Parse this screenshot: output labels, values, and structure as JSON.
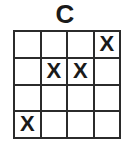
{
  "figure": {
    "title": "C",
    "mark_symbol": "X",
    "colors": {
      "background": "#ffffff",
      "grid_line": "#2b2b2b",
      "text": "#1a1a1a"
    }
  },
  "chart_data": {
    "type": "table",
    "title": "C",
    "xlabel": "",
    "ylabel": "",
    "rows": 4,
    "columns": 4,
    "grid": true,
    "legend": "",
    "annotations": [
      "X at row 1 column 4",
      "X at row 2 column 2",
      "X at row 2 column 3",
      "X at row 4 column 1"
    ],
    "filled_count": 4,
    "cells": [
      [
        "",
        "",
        "",
        "X"
      ],
      [
        "",
        "X",
        "X",
        ""
      ],
      [
        "",
        "",
        "",
        ""
      ],
      [
        "X",
        "",
        "",
        ""
      ]
    ]
  }
}
